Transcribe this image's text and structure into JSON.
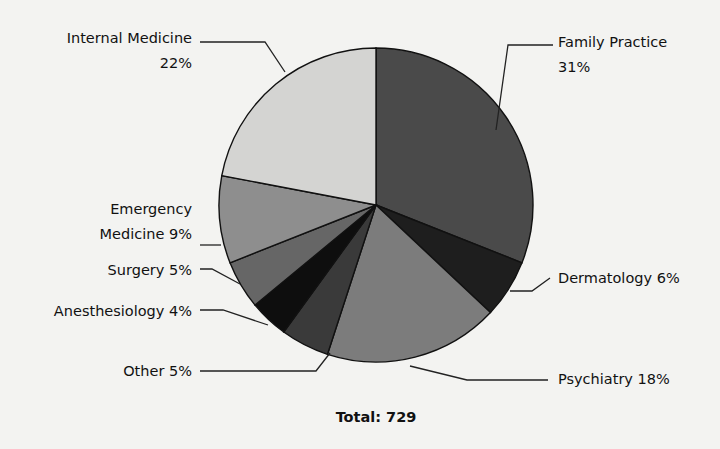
{
  "chart_data": {
    "type": "pie",
    "title": "",
    "total_label": "Total: 729",
    "total": 729,
    "slices": [
      {
        "name": "Family Practice",
        "value": 31,
        "label_line1": "Family Practice",
        "label_line2": "31%",
        "color": "#4a4a4a"
      },
      {
        "name": "Dermatology",
        "value": 6,
        "label_line1": "Dermatology 6%",
        "label_line2": "",
        "color": "#1e1e1e"
      },
      {
        "name": "Psychiatry",
        "value": 18,
        "label_line1": "Psychiatry 18%",
        "label_line2": "",
        "color": "#7c7c7c"
      },
      {
        "name": "Other",
        "value": 5,
        "label_line1": "Other 5%",
        "label_line2": "",
        "color": "#3a3a3a"
      },
      {
        "name": "Anesthesiology",
        "value": 4,
        "label_line1": "Anesthesiology 4%",
        "label_line2": "",
        "color": "#0e0e0e"
      },
      {
        "name": "Surgery",
        "value": 5,
        "label_line1": "Surgery 5%",
        "label_line2": "",
        "color": "#666666"
      },
      {
        "name": "Emergency Medicine",
        "value": 9,
        "label_line1": "Emergency",
        "label_line2": "Medicine 9%",
        "color": "#8e8e8e"
      },
      {
        "name": "Internal Medicine",
        "value": 22,
        "label_line1": "Internal Medicine",
        "label_line2": "22%",
        "color": "#d4d4d2"
      }
    ],
    "units": "percent",
    "legend": "none (callout labels)"
  }
}
